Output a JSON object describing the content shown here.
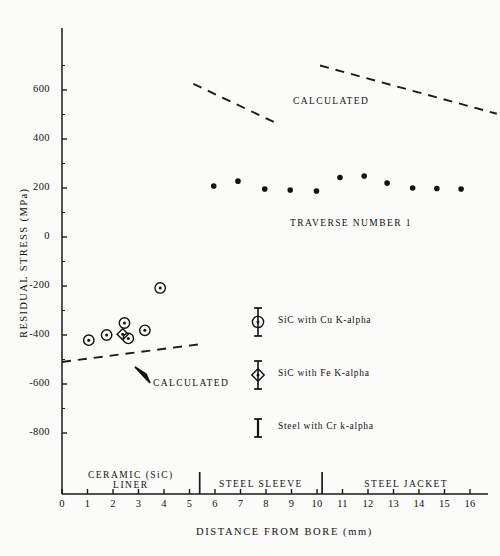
{
  "chart_data": {
    "type": "scatter",
    "title": "",
    "xlabel": "DISTANCE FROM BORE (mm)",
    "ylabel": "RESIDUAL STRESS (MPa)",
    "xlim": [
      0,
      16.8
    ],
    "ylim": [
      -900,
      760
    ],
    "xticks": [
      "0",
      "1",
      "2",
      "3",
      "4",
      "5",
      "6",
      "7",
      "8",
      "9",
      "10",
      "11",
      "12",
      "13",
      "14",
      "15",
      "16"
    ],
    "yticks": [
      "600",
      "400",
      "200",
      "0",
      "-200",
      "-400",
      "-600",
      "-800"
    ],
    "grid": false,
    "legend_position": "inside-center",
    "annotations": [
      {
        "text": "CALCULATED",
        "x": 8.2,
        "y": 505
      },
      {
        "text": "TRAVERSE NUMBER 1",
        "x": 9.4,
        "y": 140
      },
      {
        "text": "CALCULATED",
        "x": 3.6,
        "y": -558
      }
    ],
    "regions": [
      {
        "label": "CERAMIC (SiC)\nLINER",
        "x_start": 0,
        "x_end": 5.4
      },
      {
        "label": "STEEL SLEEVE",
        "x_start": 5.4,
        "x_end": 10.2
      },
      {
        "label": "STEEL JACKET",
        "x_start": 10.2,
        "x_end": 16.8
      }
    ],
    "region_dividers": [
      5.4,
      10.2
    ],
    "series": [
      {
        "name": "SiC with Cu K-alpha",
        "marker": "circle-dot",
        "points": [
          {
            "x": 1.05,
            "y": -421
          },
          {
            "x": 1.75,
            "y": -400
          },
          {
            "x": 2.45,
            "y": -351
          },
          {
            "x": 2.6,
            "y": -414
          },
          {
            "x": 3.25,
            "y": -381
          },
          {
            "x": 3.85,
            "y": -208
          }
        ]
      },
      {
        "name": "SiC with Fe K-alpha",
        "marker": "diamond-dot",
        "points": [
          {
            "x": 2.38,
            "y": -397
          }
        ]
      },
      {
        "name": "Steel with Cr k-alpha",
        "marker": "filled-circle",
        "points": [
          {
            "x": 5.95,
            "y": 208
          },
          {
            "x": 6.9,
            "y": 228
          },
          {
            "x": 7.95,
            "y": 196
          },
          {
            "x": 8.95,
            "y": 192
          },
          {
            "x": 9.98,
            "y": 188
          },
          {
            "x": 10.9,
            "y": 243
          },
          {
            "x": 11.85,
            "y": 249
          },
          {
            "x": 12.75,
            "y": 220
          },
          {
            "x": 13.75,
            "y": 200
          },
          {
            "x": 14.7,
            "y": 198
          },
          {
            "x": 15.65,
            "y": 196
          }
        ]
      }
    ],
    "calculated_lines": [
      {
        "name": "calculated-upper-left",
        "x1": 5.15,
        "y1": 625,
        "x2": 8.4,
        "y2": 465,
        "style": "dashed"
      },
      {
        "name": "calculated-upper-right",
        "x1": 10.12,
        "y1": 700,
        "x2": 17.05,
        "y2": 503,
        "style": "dashed"
      },
      {
        "name": "calculated-lower",
        "x1": 0.0,
        "y1": -510,
        "x2": 5.45,
        "y2": -437,
        "style": "dashed"
      }
    ]
  },
  "legend": {
    "items": [
      {
        "marker": "circle-dot",
        "label": "SiC with Cu K-alpha"
      },
      {
        "marker": "diamond-dot",
        "label": "SiC with Fe K-alpha"
      },
      {
        "marker": "error-bar",
        "label": "Steel with Cr k-alpha"
      }
    ]
  }
}
